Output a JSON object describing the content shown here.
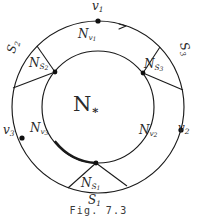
{
  "figure": {
    "caption": "Fig. 7.3",
    "center_region": {
      "base": "N",
      "sub": "∗"
    },
    "outer_circle": {
      "name": "outer-boundary-circle"
    },
    "inner_circle": {
      "name": "inner-boundary-circle"
    },
    "orientation_arrow": "arrowhead",
    "vertices": [
      {
        "id": "v1",
        "base": "v",
        "sub": "1",
        "x": 98,
        "y": 12,
        "label_x": 92,
        "label_y": 0
      },
      {
        "id": "v2",
        "base": "v",
        "sub": "2",
        "x": 178,
        "y": 128,
        "label_x": 178,
        "label_y": 122
      },
      {
        "id": "v3",
        "base": "v",
        "sub": "3",
        "x": 22,
        "y": 130,
        "label_x": 3,
        "label_y": 124
      }
    ],
    "junction_points": [
      {
        "id": "j-upper-left",
        "x": 55,
        "y": 72
      },
      {
        "id": "j-upper-right",
        "x": 143,
        "y": 73
      },
      {
        "id": "j-bottom",
        "x": 96,
        "y": 163
      }
    ],
    "vertex_regions": [
      {
        "id": "Nv1",
        "base": "N",
        "sub": "v",
        "sub2": "1",
        "x": 78,
        "y": 28
      },
      {
        "id": "Nv2",
        "base": "N",
        "sub": "v",
        "sub2": "2",
        "x": 139,
        "y": 124
      },
      {
        "id": "Nv3",
        "base": "N",
        "sub": "v",
        "sub2": "3",
        "x": 30,
        "y": 122
      }
    ],
    "edge_regions": [
      {
        "id": "NS1",
        "base": "N",
        "sub": "S",
        "sub2": "1",
        "x": 81,
        "y": 177
      },
      {
        "id": "NS2",
        "base": "N",
        "sub": "S",
        "sub2": "2",
        "x": 29,
        "y": 57
      },
      {
        "id": "NS3",
        "base": "N",
        "sub": "S",
        "sub2": "3",
        "x": 144,
        "y": 58
      }
    ],
    "edge_labels": [
      {
        "id": "S1",
        "base": "S",
        "sub": "1",
        "x": 88,
        "y": 194,
        "rotate": "none"
      },
      {
        "id": "S2",
        "base": "S",
        "sub": "2",
        "x": 7,
        "y": 40,
        "rotate": "left"
      },
      {
        "id": "S3",
        "base": "S",
        "sub": "3",
        "x": 178,
        "y": 42,
        "rotate": "right"
      }
    ],
    "colors": {
      "ink": "#1a1a1a",
      "label_ink": "#2a2a2a",
      "caption_ink": "#3a3a3a",
      "paper": "#ffffff"
    }
  }
}
